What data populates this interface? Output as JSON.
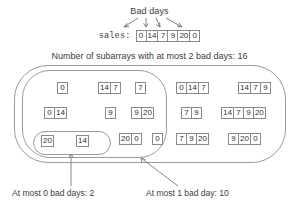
{
  "top": {
    "bad_days_label": "Bad days",
    "sales_label": "sales:",
    "sales_values": [
      "0",
      "14",
      "7",
      "9",
      "20",
      "0"
    ],
    "bad_day_indices": [
      0,
      2,
      3,
      5
    ],
    "arrow_count": 4
  },
  "caption": {
    "text": "Number of subarrays with at most 2 bad days: 16",
    "total_count": 16,
    "max_bad_days": 2
  },
  "groups": {
    "at_most_0": {
      "label": "At most 0 bad days: 2",
      "count": 2,
      "subarrays": [
        [
          "20"
        ],
        [
          "14"
        ]
      ]
    },
    "at_most_1": {
      "label": "At most 1 bad day: 10",
      "count": 10,
      "subarrays": [
        [
          "0"
        ],
        [
          "14",
          "7"
        ],
        [
          "7"
        ],
        [
          "0",
          "14"
        ],
        [
          "9"
        ],
        [
          "9",
          "20"
        ],
        [
          "20",
          "0"
        ],
        [
          "0"
        ]
      ]
    },
    "at_most_2": {
      "count": 16,
      "subarrays": [
        [
          "0",
          "14",
          "7"
        ],
        [
          "14",
          "7",
          "9"
        ],
        [
          "7",
          "9"
        ],
        [
          "14",
          "7",
          "9",
          "20"
        ],
        [
          "7",
          "9",
          "20"
        ],
        [
          "9",
          "20",
          "0"
        ]
      ]
    }
  },
  "colors": {
    "ink": "#3a3a3a",
    "cell_border": "#8a8a8a",
    "oval_border": "#9a9a9a",
    "background": "#ffffff"
  }
}
